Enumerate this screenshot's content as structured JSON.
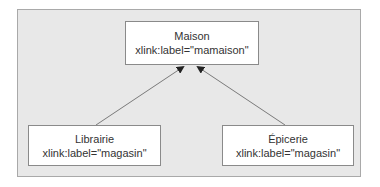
{
  "diagram": {
    "type": "xlink-linkset",
    "background_color": "#e8e8e8",
    "nodes": [
      {
        "id": "maison",
        "title": "Maison",
        "label": "xlink:label=\"mamaison\""
      },
      {
        "id": "librairie",
        "title": "Librairie",
        "label": "xlink:label=\"magasin\""
      },
      {
        "id": "epicerie",
        "title": "Épicerie",
        "label": "xlink:label=\"magasin\""
      }
    ],
    "edges": [
      {
        "from": "librairie",
        "to": "maison",
        "style": "arrow"
      },
      {
        "from": "epicerie",
        "to": "maison",
        "style": "arrow"
      }
    ]
  }
}
